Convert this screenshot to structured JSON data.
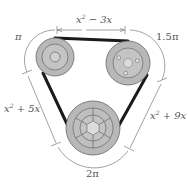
{
  "diagram": {
    "type": "belt-and-pulley",
    "labels": {
      "top_segment": {
        "base": "x",
        "exp": "2",
        "rest": " − 3x"
      },
      "left_arc": "π",
      "right_arc": "1.5π",
      "left_segment": {
        "base": "x",
        "exp": "2",
        "rest": " + 5x"
      },
      "right_segment": {
        "base": "x",
        "exp": "2",
        "rest": " + 9x"
      },
      "bottom_arc": "2π"
    },
    "pulleys": [
      {
        "name": "top-left-pulley",
        "cx": 55,
        "cy": 57,
        "r": 19
      },
      {
        "name": "top-right-pulley",
        "cx": 128,
        "cy": 63,
        "r": 22
      },
      {
        "name": "bottom-pulley",
        "cx": 93,
        "cy": 128,
        "r": 27
      }
    ],
    "colors": {
      "pulley_fill": "#b8b8b8",
      "pulley_inner": "#cfcfcf",
      "belt": "#1a1a1a",
      "dimension_line": "#888888",
      "text": "#555555"
    }
  }
}
